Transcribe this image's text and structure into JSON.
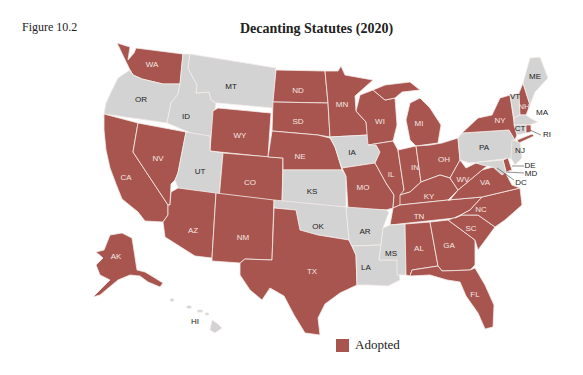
{
  "figure_label": "Figure 10.2",
  "title": "Decanting Statutes (2020)",
  "colors": {
    "adopted": "#a9554f",
    "not_adopted": "#d3d3d3",
    "label_on_adopted": "#f3e6e2",
    "label_on_not": "#222222"
  },
  "legend": {
    "items": [
      {
        "label": "Adopted",
        "color": "#a9554f"
      }
    ]
  },
  "states": {
    "adopted": [
      "WA",
      "CA",
      "NV",
      "AZ",
      "NM",
      "WY",
      "CO",
      "ND",
      "SD",
      "NE",
      "TX",
      "MN",
      "WI",
      "MI",
      "IL",
      "IN",
      "OH",
      "MO",
      "KY",
      "TN",
      "AL",
      "GA",
      "FL",
      "SC",
      "NC",
      "VA",
      "WV",
      "NY",
      "NH",
      "RI",
      "DE",
      "AK"
    ],
    "not_adopted": [
      "OR",
      "ID",
      "MT",
      "UT",
      "KS",
      "OK",
      "IA",
      "AR",
      "LA",
      "MS",
      "PA",
      "NJ",
      "MD",
      "DC",
      "CT",
      "MA",
      "VT",
      "ME",
      "HI"
    ]
  },
  "labels": {
    "WA": "WA",
    "OR": "OR",
    "CA": "CA",
    "NV": "NV",
    "ID": "ID",
    "MT": "MT",
    "WY": "WY",
    "UT": "UT",
    "CO": "CO",
    "AZ": "AZ",
    "NM": "NM",
    "ND": "ND",
    "SD": "SD",
    "NE": "NE",
    "KS": "KS",
    "OK": "OK",
    "TX": "TX",
    "MN": "MN",
    "IA": "IA",
    "MO": "MO",
    "AR": "AR",
    "LA": "LA",
    "WI": "WI",
    "IL": "IL",
    "MS": "MS",
    "MI": "MI",
    "IN": "IN",
    "KY": "KY",
    "TN": "TN",
    "AL": "AL",
    "OH": "OH",
    "WV": "WV",
    "VA": "VA",
    "NC": "NC",
    "SC": "SC",
    "GA": "GA",
    "FL": "FL",
    "PA": "PA",
    "NY": "NY",
    "VT": "VT",
    "NH": "NH",
    "ME": "ME",
    "MA": "MA",
    "CT": "CT",
    "RI": "RI",
    "NJ": "NJ",
    "DE": "DE",
    "MD": "MD",
    "DC": "DC",
    "AK": "AK",
    "HI": "HI"
  }
}
